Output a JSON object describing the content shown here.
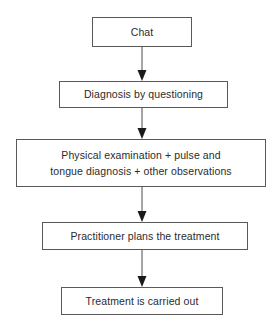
{
  "diagram": {
    "type": "flowchart",
    "orientation": "top-to-bottom",
    "background_color": "#ffffff",
    "border_color": "#595959",
    "text_color": "#2b2b2b",
    "arrow_color": "#1a1a1a",
    "nodes": [
      {
        "id": "chat",
        "lines": [
          "Chat"
        ],
        "text": "Chat"
      },
      {
        "id": "diagnosis",
        "lines": [
          "Diagnosis by questioning"
        ],
        "text": "Diagnosis by questioning"
      },
      {
        "id": "examination",
        "lines": [
          "Physical examination + pulse and",
          "tongue diagnosis + other observations"
        ],
        "text": "Physical examination + pulse and tongue diagnosis + other observations"
      },
      {
        "id": "plans",
        "lines": [
          "Practitioner plans the treatment"
        ],
        "text": "Practitioner plans the treatment"
      },
      {
        "id": "carried_out",
        "lines": [
          "Treatment is carried out"
        ],
        "text": "Treatment is carried out"
      }
    ],
    "connectors": [
      {
        "id": "chat-to-diagnosis",
        "from": "chat",
        "to": "diagnosis",
        "style": "solid-arrow-down"
      },
      {
        "id": "diagnosis-to-examination",
        "from": "diagnosis",
        "to": "examination",
        "style": "solid-arrow-down"
      },
      {
        "id": "examination-to-plans",
        "from": "examination",
        "to": "plans",
        "style": "solid-arrow-down"
      },
      {
        "id": "plans-to-carried-out",
        "from": "plans",
        "to": "carried_out",
        "style": "solid-arrow-down"
      }
    ]
  }
}
